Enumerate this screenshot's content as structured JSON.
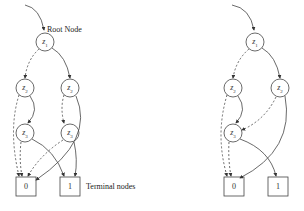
{
  "diagram": {
    "left": {
      "title": "Full binary decision diagram",
      "root_annotation": "Root Node",
      "terminal_annotation": "Terminal nodes",
      "nodes": [
        {
          "id": "z1",
          "var": "z",
          "sub": "1"
        },
        {
          "id": "z2a",
          "var": "z",
          "sub": "2"
        },
        {
          "id": "z2b",
          "var": "z",
          "sub": "2"
        },
        {
          "id": "z3a",
          "var": "z",
          "sub": "3"
        },
        {
          "id": "z3b",
          "var": "z",
          "sub": "3"
        }
      ],
      "terminals": [
        {
          "id": "t0",
          "label": "0"
        },
        {
          "id": "t1",
          "label": "1"
        }
      ]
    },
    "right": {
      "title": "Reduced binary decision diagram",
      "nodes": [
        {
          "id": "z1",
          "var": "z",
          "sub": "1"
        },
        {
          "id": "z2a",
          "var": "z",
          "sub": "2"
        },
        {
          "id": "z2b",
          "var": "z",
          "sub": "2"
        },
        {
          "id": "z3",
          "var": "z",
          "sub": "3"
        }
      ],
      "terminals": [
        {
          "id": "t0",
          "label": "0"
        },
        {
          "id": "t1",
          "label": "1"
        }
      ]
    },
    "legend": {
      "dashed": "low (0) edge",
      "solid": "high (1) edge"
    }
  }
}
